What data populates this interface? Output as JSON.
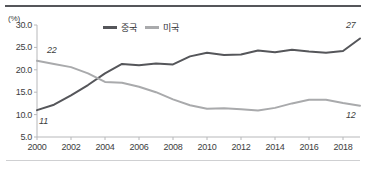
{
  "chart_data": {
    "type": "line",
    "title": "",
    "subtitle": "",
    "xlabel": "",
    "ylabel": "",
    "unit_label": "(%)",
    "grid": false,
    "legend_position": "top-center",
    "xlim": [
      2000,
      2019
    ],
    "ylim": [
      5.0,
      30.0
    ],
    "ytick_labels": [
      "5.0",
      "10.0",
      "15.0",
      "20.0",
      "25.0",
      "30.0"
    ],
    "ytick_values": [
      5.0,
      10.0,
      15.0,
      20.0,
      25.0,
      30.0
    ],
    "xtick_labels": [
      "2000",
      "2002",
      "2004",
      "2006",
      "2008",
      "2010",
      "2012",
      "2014",
      "2016",
      "2018"
    ],
    "xtick_values": [
      2000,
      2002,
      2004,
      2006,
      2008,
      2010,
      2012,
      2014,
      2016,
      2018
    ],
    "x": [
      2000,
      2001,
      2002,
      2003,
      2004,
      2005,
      2006,
      2007,
      2008,
      2009,
      2010,
      2011,
      2012,
      2013,
      2014,
      2015,
      2016,
      2017,
      2018,
      2019
    ],
    "series": [
      {
        "name": "중국",
        "color": "#55565a",
        "values": [
          11.0,
          12.2,
          14.3,
          16.6,
          19.2,
          21.3,
          21.0,
          21.4,
          21.2,
          23.0,
          23.8,
          23.3,
          23.4,
          24.3,
          23.9,
          24.5,
          24.1,
          23.8,
          24.2,
          27.0
        ]
      },
      {
        "name": "미국",
        "color": "#a9aaac",
        "values": [
          22.0,
          21.3,
          20.6,
          19.2,
          17.3,
          17.1,
          16.2,
          15.0,
          13.4,
          12.1,
          11.3,
          11.4,
          11.2,
          10.9,
          11.5,
          12.5,
          13.3,
          13.3,
          12.6,
          12.0
        ]
      }
    ],
    "annotations": [
      {
        "name": "usa-start-value",
        "text": "22",
        "x": 2000,
        "y": 22.0
      },
      {
        "name": "china-start-value",
        "text": "11",
        "x": 2000,
        "y": 11.0
      },
      {
        "name": "china-end-value",
        "text": "27",
        "x": 2019,
        "y": 27.0
      },
      {
        "name": "usa-end-value",
        "text": "12",
        "x": 2019,
        "y": 12.0
      }
    ],
    "axis_color": "#b7b8ba",
    "text_color": "#3c3d40"
  }
}
